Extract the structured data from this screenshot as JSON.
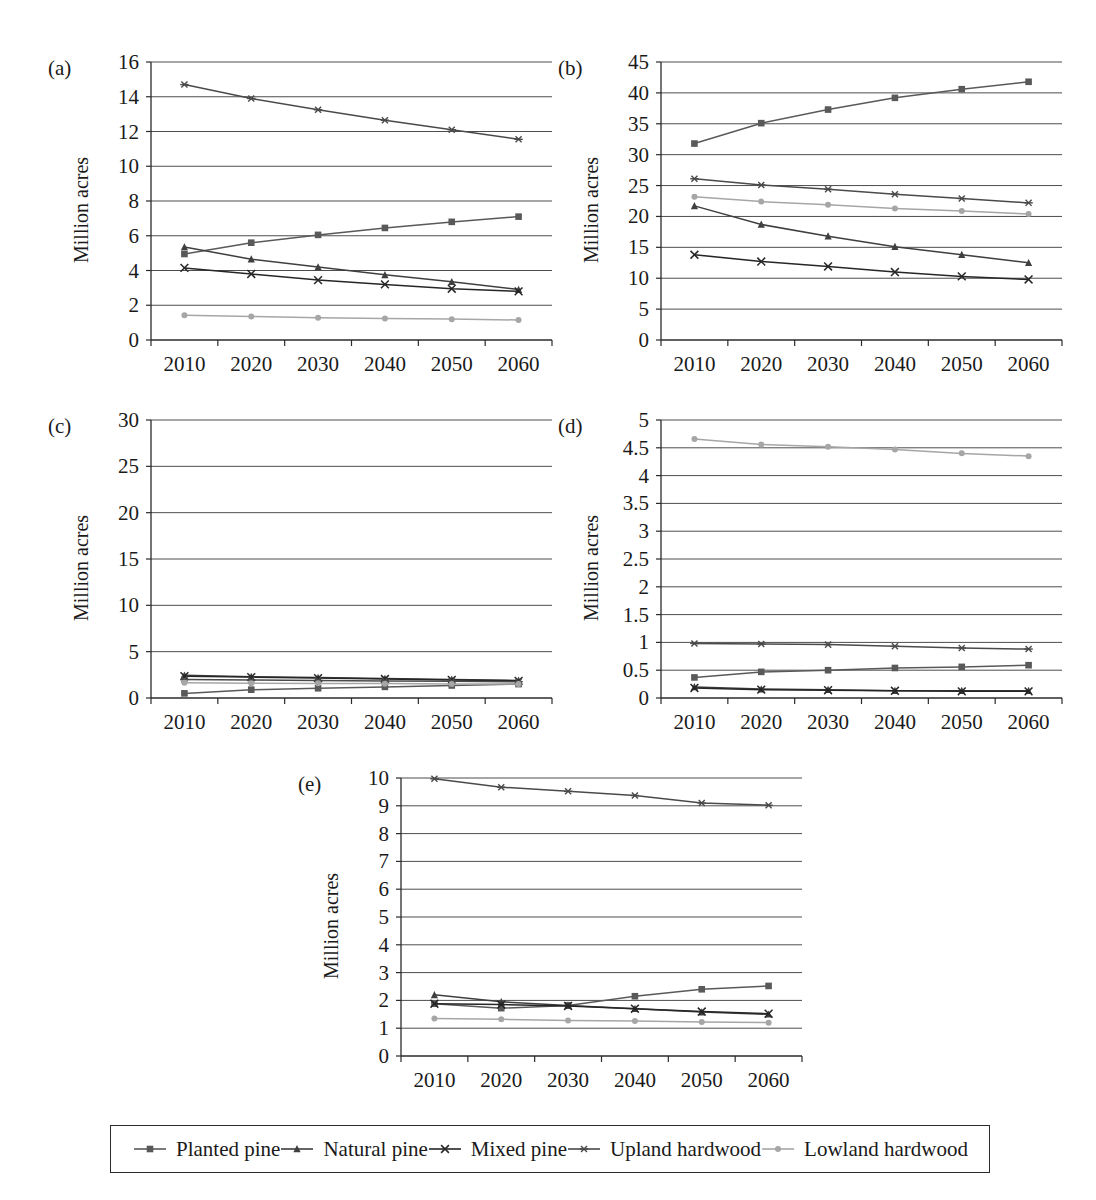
{
  "figure": {
    "axis_title": "Million acres",
    "panel_labels": [
      "(a)",
      "(b)",
      "(c)",
      "(d)",
      "(e)"
    ],
    "colors": {
      "planted_pine": "#595959",
      "natural_pine": "#3f3f3f",
      "mixed_pine": "#262626",
      "upland_hardwood": "#4a4a4a",
      "lowland_hardwood": "#a6a6a6",
      "grid": "#4d4d4d",
      "axis": "#2b2b2b",
      "text": "#1a1a1a"
    }
  },
  "legend": {
    "items": [
      {
        "label": "Planted pine",
        "marker": "square-marker",
        "color": "#595959"
      },
      {
        "label": "Natural pine",
        "marker": "triangle-marker",
        "color": "#3f3f3f"
      },
      {
        "label": "Mixed pine",
        "marker": "cross-marker",
        "color": "#262626"
      },
      {
        "label": "Upland hardwood",
        "marker": "asterisk-marker",
        "color": "#4a4a4a"
      },
      {
        "label": "Lowland hardwood",
        "marker": "circle-marker",
        "color": "#a6a6a6"
      }
    ]
  },
  "chart_data": [
    {
      "id": "a",
      "type": "line",
      "panel": "(a)",
      "title": "",
      "xlabel": "",
      "ylabel": "Million acres",
      "x": [
        "2010",
        "2020",
        "2030",
        "2040",
        "2050",
        "2060"
      ],
      "xticklabels": [
        "2010",
        "2020",
        "2030",
        "2040",
        "2050",
        "2060"
      ],
      "ylim": [
        0,
        16
      ],
      "yticks": [
        0,
        2,
        4,
        6,
        8,
        10,
        12,
        14,
        16
      ],
      "yticklabels": [
        "0",
        "2",
        "4",
        "6",
        "8",
        "10",
        "12",
        "14",
        "16"
      ],
      "grid": true,
      "legend_position": "figure-bottom",
      "series": [
        {
          "name": "Planted pine",
          "marker": "square-marker",
          "color": "#595959",
          "values": [
            4.95,
            5.6,
            6.05,
            6.45,
            6.8,
            7.1
          ]
        },
        {
          "name": "Natural pine",
          "marker": "triangle-marker",
          "color": "#3f3f3f",
          "values": [
            5.35,
            4.65,
            4.2,
            3.75,
            3.35,
            2.9
          ]
        },
        {
          "name": "Mixed pine",
          "marker": "cross-marker",
          "color": "#262626",
          "values": [
            4.15,
            3.8,
            3.45,
            3.2,
            2.95,
            2.8
          ]
        },
        {
          "name": "Upland hardwood",
          "marker": "asterisk-marker",
          "color": "#4a4a4a",
          "values": [
            14.7,
            13.9,
            13.25,
            12.65,
            12.1,
            11.55
          ]
        },
        {
          "name": "Lowland hardwood",
          "marker": "circle-marker",
          "color": "#a6a6a6",
          "values": [
            1.42,
            1.35,
            1.28,
            1.24,
            1.2,
            1.15
          ]
        }
      ]
    },
    {
      "id": "b",
      "type": "line",
      "panel": "(b)",
      "title": "",
      "xlabel": "",
      "ylabel": "Million acres",
      "x": [
        "2010",
        "2020",
        "2030",
        "2040",
        "2050",
        "2060"
      ],
      "xticklabels": [
        "2010",
        "2020",
        "2030",
        "2040",
        "2050",
        "2060"
      ],
      "ylim": [
        0,
        45
      ],
      "yticks": [
        0,
        5,
        10,
        15,
        20,
        25,
        30,
        35,
        40,
        45
      ],
      "yticklabels": [
        "0",
        "5",
        "10",
        "15",
        "20",
        "25",
        "30",
        "35",
        "40",
        "45"
      ],
      "grid": true,
      "legend_position": "figure-bottom",
      "series": [
        {
          "name": "Planted pine",
          "marker": "square-marker",
          "color": "#595959",
          "values": [
            31.8,
            35.1,
            37.3,
            39.2,
            40.6,
            41.8
          ]
        },
        {
          "name": "Natural pine",
          "marker": "triangle-marker",
          "color": "#3f3f3f",
          "values": [
            21.7,
            18.7,
            16.8,
            15.1,
            13.8,
            12.5
          ]
        },
        {
          "name": "Mixed pine",
          "marker": "cross-marker",
          "color": "#262626",
          "values": [
            13.8,
            12.7,
            11.9,
            11.0,
            10.3,
            9.8
          ]
        },
        {
          "name": "Upland hardwood",
          "marker": "asterisk-marker",
          "color": "#4a4a4a",
          "values": [
            26.1,
            25.1,
            24.4,
            23.6,
            22.9,
            22.2
          ]
        },
        {
          "name": "Lowland hardwood",
          "marker": "circle-marker",
          "color": "#a6a6a6",
          "values": [
            23.2,
            22.4,
            21.9,
            21.3,
            20.9,
            20.4
          ]
        }
      ]
    },
    {
      "id": "c",
      "type": "line",
      "panel": "(c)",
      "title": "",
      "xlabel": "",
      "ylabel": "Million acres",
      "x": [
        "2010",
        "2020",
        "2030",
        "2040",
        "2050",
        "2060"
      ],
      "xticklabels": [
        "2010",
        "2020",
        "2030",
        "2040",
        "2050",
        "2060"
      ],
      "ylim": [
        0,
        30
      ],
      "yticks": [
        0,
        5,
        10,
        15,
        20,
        25,
        30
      ],
      "yticklabels": [
        "0",
        "5",
        "10",
        "15",
        "20",
        "25",
        "30"
      ],
      "grid": true,
      "legend_position": "figure-bottom",
      "series": [
        {
          "name": "Planted pine",
          "marker": "square-marker",
          "color": "#595959",
          "values": [
            0.5,
            0.9,
            1.05,
            1.2,
            1.35,
            1.5
          ]
        },
        {
          "name": "Natural pine",
          "marker": "triangle-marker",
          "color": "#3f3f3f",
          "values": [
            2.45,
            2.3,
            2.2,
            2.1,
            2.0,
            1.9
          ]
        },
        {
          "name": "Mixed pine",
          "marker": "cross-marker",
          "color": "#262626",
          "values": [
            2.35,
            2.25,
            2.15,
            2.05,
            1.95,
            1.85
          ]
        },
        {
          "name": "Upland hardwood",
          "marker": "asterisk-marker",
          "color": "#4a4a4a",
          "values": [
            2.0,
            1.95,
            1.9,
            1.85,
            1.8,
            1.75
          ]
        },
        {
          "name": "Lowland hardwood",
          "marker": "circle-marker",
          "color": "#a6a6a6",
          "values": [
            1.65,
            1.6,
            1.58,
            1.55,
            1.52,
            1.5
          ]
        }
      ]
    },
    {
      "id": "d",
      "type": "line",
      "panel": "(d)",
      "title": "",
      "xlabel": "",
      "ylabel": "Million acres",
      "x": [
        "2010",
        "2020",
        "2030",
        "2040",
        "2050",
        "2060"
      ],
      "xticklabels": [
        "2010",
        "2020",
        "2030",
        "2040",
        "2050",
        "2060"
      ],
      "ylim": [
        0,
        5
      ],
      "yticks": [
        0,
        0.5,
        1,
        1.5,
        2,
        2.5,
        3,
        3.5,
        4,
        4.5,
        5
      ],
      "yticklabels": [
        "0",
        "0.5",
        "1",
        "1.5",
        "2",
        "2.5",
        "3",
        "3.5",
        "4",
        "4.5",
        "5"
      ],
      "grid": true,
      "legend_position": "figure-bottom",
      "series": [
        {
          "name": "Planted pine",
          "marker": "square-marker",
          "color": "#595959",
          "values": [
            0.37,
            0.47,
            0.5,
            0.54,
            0.56,
            0.59
          ]
        },
        {
          "name": "Natural pine",
          "marker": "triangle-marker",
          "color": "#3f3f3f",
          "values": [
            0.2,
            0.16,
            0.15,
            0.13,
            0.13,
            0.13
          ]
        },
        {
          "name": "Mixed pine",
          "marker": "cross-marker",
          "color": "#262626",
          "values": [
            0.18,
            0.15,
            0.14,
            0.13,
            0.12,
            0.12
          ]
        },
        {
          "name": "Upland hardwood",
          "marker": "asterisk-marker",
          "color": "#4a4a4a",
          "values": [
            0.98,
            0.97,
            0.96,
            0.93,
            0.9,
            0.88
          ]
        },
        {
          "name": "Lowland hardwood",
          "marker": "circle-marker",
          "color": "#a6a6a6",
          "values": [
            4.66,
            4.56,
            4.52,
            4.47,
            4.4,
            4.35
          ]
        }
      ]
    },
    {
      "id": "e",
      "type": "line",
      "panel": "(e)",
      "title": "",
      "xlabel": "",
      "ylabel": "Million acres",
      "x": [
        "2010",
        "2020",
        "2030",
        "2040",
        "2050",
        "2060"
      ],
      "xticklabels": [
        "2010",
        "2020",
        "2030",
        "2040",
        "2050",
        "2060"
      ],
      "ylim": [
        0,
        10
      ],
      "yticks": [
        0,
        1,
        2,
        3,
        4,
        5,
        6,
        7,
        8,
        9,
        10
      ],
      "yticklabels": [
        "0",
        "1",
        "2",
        "3",
        "4",
        "5",
        "6",
        "7",
        "8",
        "9",
        "10"
      ],
      "grid": true,
      "legend_position": "figure-bottom",
      "series": [
        {
          "name": "Planted pine",
          "marker": "square-marker",
          "color": "#595959",
          "values": [
            1.88,
            1.72,
            1.82,
            2.15,
            2.4,
            2.52
          ]
        },
        {
          "name": "Natural pine",
          "marker": "triangle-marker",
          "color": "#3f3f3f",
          "values": [
            2.2,
            1.95,
            1.82,
            1.7,
            1.58,
            1.5
          ]
        },
        {
          "name": "Mixed pine",
          "marker": "cross-marker",
          "color": "#262626",
          "values": [
            1.88,
            1.85,
            1.8,
            1.7,
            1.6,
            1.52
          ]
        },
        {
          "name": "Upland hardwood",
          "marker": "asterisk-marker",
          "color": "#4a4a4a",
          "values": [
            9.97,
            9.67,
            9.52,
            9.37,
            9.1,
            9.02
          ]
        },
        {
          "name": "Lowland hardwood",
          "marker": "circle-marker",
          "color": "#a6a6a6",
          "values": [
            1.35,
            1.32,
            1.28,
            1.26,
            1.22,
            1.2
          ]
        }
      ]
    }
  ]
}
